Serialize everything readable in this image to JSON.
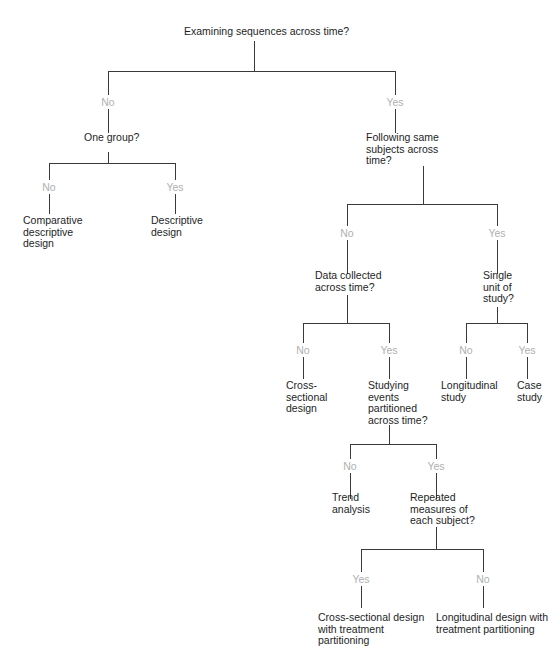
{
  "diagram": {
    "type": "decision-tree",
    "root": "Examining sequences across time?",
    "nodes": {
      "q_root": "Examining sequences across time?",
      "q_one_group": "One group?",
      "t_comparative": "Comparative\ndescriptive\ndesign",
      "t_descriptive": "Descriptive\ndesign",
      "q_following": "Following same\nsubjects across\ntime?",
      "q_data_collected": "Data collected\nacross time?",
      "q_single_unit": "Single\nunit of\nstudy?",
      "t_cross_sectional": "Cross-\nsectional\ndesign",
      "q_studying_events": "Studying\nevents\npartitioned\nacross time?",
      "t_longitudinal": "Longitudinal\nstudy",
      "t_case_study": "Case\nstudy",
      "t_trend": "Trend\nanalysis",
      "q_repeated": "Repeated\nmeasures of\neach subject?",
      "t_cs_treatment": "Cross-sectional design\nwith treatment\npartitioning",
      "t_long_treatment": "Longitudinal design with\ntreatment partitioning"
    },
    "edges": {
      "root_no": "No",
      "root_yes": "Yes",
      "onegroup_no": "No",
      "onegroup_yes": "Yes",
      "following_no": "No",
      "following_yes": "Yes",
      "datacollected_no": "No",
      "datacollected_yes": "Yes",
      "single_no": "No",
      "single_yes": "Yes",
      "studying_no": "No",
      "studying_yes": "Yes",
      "repeated_yes": "Yes",
      "repeated_no": "No"
    },
    "colors": {
      "line": "#3a3a3a",
      "text": "#1e1e1e",
      "edge_label": "#b0b0b0"
    }
  }
}
